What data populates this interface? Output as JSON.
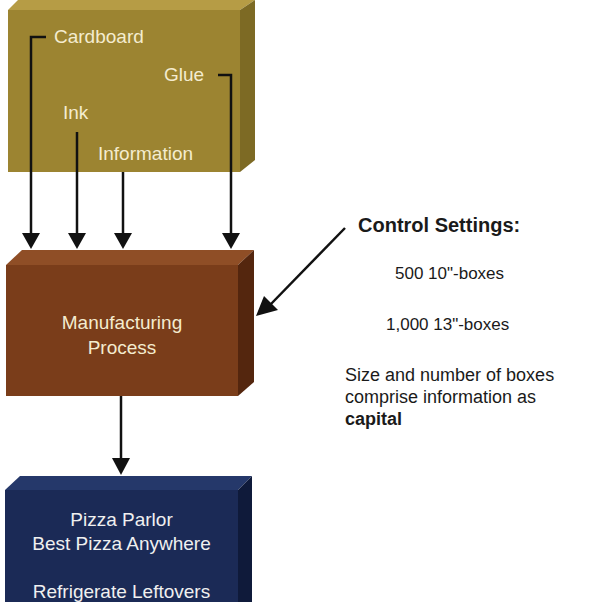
{
  "diagram": {
    "inputs_block": {
      "color_front": "#9c8431",
      "color_top": "#b69c45",
      "color_side": "#7d6a24",
      "labels": {
        "cardboard": "Cardboard",
        "glue": "Glue",
        "ink": "Ink",
        "information": "Information"
      }
    },
    "process_block": {
      "color_front": "#7a3d1a",
      "color_top": "#8f4e26",
      "color_side": "#54260e",
      "line1": "Manufacturing",
      "line2": "Process"
    },
    "output_block": {
      "color_front": "#1b2a56",
      "color_top": "#25386a",
      "color_side": "#0f1a3a",
      "line1": "Pizza Parlor",
      "line2": "Best Pizza Anywhere",
      "line3": "Refrigerate Leftovers"
    },
    "control": {
      "title": "Control Settings:",
      "setting1": "500 10\"-boxes",
      "setting2": "1,000 13\"-boxes",
      "note_line1": "Size and number of boxes",
      "note_line2": "comprise information as",
      "note_bold": "capital"
    }
  }
}
